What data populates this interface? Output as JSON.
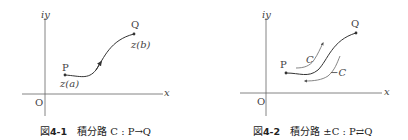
{
  "figures": [
    {
      "id": "4-1",
      "caption_prefix": "図",
      "caption_number": "4-1",
      "caption_text": "積分路 C : P→Q",
      "axis_labels": {
        "y": "iy",
        "x": "x",
        "origin": "O"
      },
      "points": {
        "start": "P",
        "end": "Q"
      },
      "point_labels": {
        "start": "z(a)",
        "end": "z(b)"
      }
    },
    {
      "id": "4-2",
      "caption_prefix": "図",
      "caption_number": "4-2",
      "caption_text": "積分路 ±C : P⇄Q",
      "axis_labels": {
        "y": "iy",
        "x": "x",
        "origin": "O"
      },
      "points": {
        "start": "P",
        "end": "Q"
      },
      "path_labels": {
        "forward": "C",
        "reverse": "−C"
      }
    }
  ],
  "colors": {
    "ink": "#333333",
    "light_ink": "#777777",
    "background": "#ffffff"
  }
}
